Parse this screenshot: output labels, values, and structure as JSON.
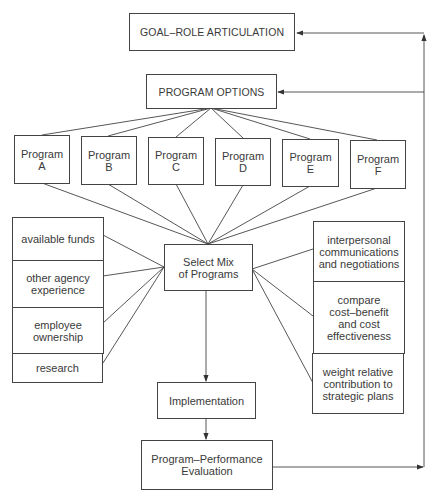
{
  "diagram": {
    "goal": {
      "label": "GOAL–ROLE ARTICULATION"
    },
    "options": {
      "label": "PROGRAM OPTIONS"
    },
    "programs": [
      {
        "label": "Program\nA"
      },
      {
        "label": "Program\nB"
      },
      {
        "label": "Program\nC"
      },
      {
        "label": "Program\nD"
      },
      {
        "label": "Program\nE"
      },
      {
        "label": "Program\nF"
      }
    ],
    "select_mix": {
      "label": "Select Mix\nof Programs"
    },
    "left_factors": [
      {
        "label": "available funds"
      },
      {
        "label": "other agency\nexperience"
      },
      {
        "label": "employee\nownership"
      },
      {
        "label": "research"
      }
    ],
    "right_factors": [
      {
        "label": "interpersonal\ncommunications\nand negotiations"
      },
      {
        "label": "compare\ncost–benefit\nand cost\neffectiveness"
      },
      {
        "label": "weight relative\ncontribution to\nstrategic plans"
      }
    ],
    "implementation": {
      "label": "Implementation"
    },
    "evaluation": {
      "label": "Program–Performance\nEvaluation"
    },
    "colors": {
      "line": "#444444",
      "text": "#3a3a3a",
      "background": "#ffffff"
    }
  }
}
